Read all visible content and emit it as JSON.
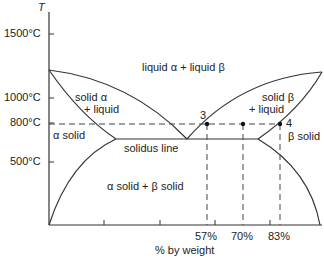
{
  "diagram": {
    "type": "eutectic phase diagram",
    "y_axis": {
      "title": "T",
      "ticks": [
        "1500°C",
        "1000°C",
        "800°C",
        "500°C"
      ]
    },
    "x_axis": {
      "title": "% by weight",
      "ticks": [
        "57%",
        "70%",
        "83%"
      ]
    },
    "regions": {
      "liquid": "liquid α + liquid β",
      "solid_alpha_liquid_1": "solid α",
      "solid_alpha_liquid_2": "+ liquid",
      "solid_beta_liquid_1": "solid β",
      "solid_beta_liquid_2": "+ liquid",
      "alpha_solid": "α solid",
      "beta_solid": "β solid",
      "solidus": "solidus line",
      "two_solids": "α solid + β solid"
    },
    "points": {
      "p3": "3",
      "p4": "4"
    },
    "colors": {
      "line": "#333333",
      "background": "#ffffff"
    }
  }
}
